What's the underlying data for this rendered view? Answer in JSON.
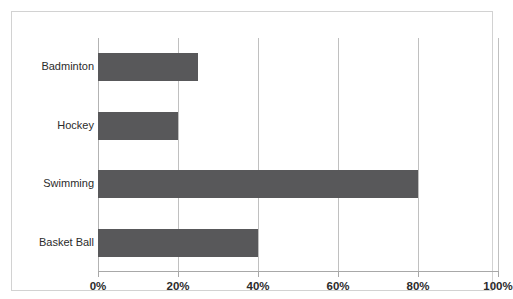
{
  "chart_data": {
    "type": "bar",
    "orientation": "horizontal",
    "title": "",
    "xlabel": "",
    "ylabel": "",
    "categories": [
      "Badminton",
      "Hockey",
      "Swimming",
      "Basket Ball"
    ],
    "values": [
      25,
      20,
      80,
      40
    ],
    "value_suffix": "%",
    "xlim": [
      0,
      100
    ],
    "xticks": [
      0,
      20,
      40,
      60,
      80,
      100
    ],
    "xtick_labels": [
      "0%",
      "20%",
      "40%",
      "60%",
      "80%",
      "100%"
    ],
    "grid": "vertical",
    "legend": "none",
    "series": [
      {
        "name": "",
        "values": [
          25,
          20,
          80,
          40
        ],
        "color": "#58585a"
      }
    ]
  },
  "colors": {
    "bar_fill": "#58585a",
    "gridline": "#c0c0c0",
    "axis_line": "#a8a8a8",
    "frame_border": "#d2d2d2",
    "background": "#ffffff",
    "text": "#2b2b2b"
  },
  "title_remnant": {
    "note": "cropped"
  }
}
